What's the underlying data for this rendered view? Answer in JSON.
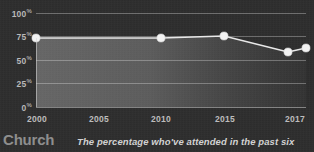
{
  "chart_data": {
    "type": "area",
    "title": "",
    "subtitle": "",
    "xlabel": "",
    "ylabel": "",
    "x": [
      "2000",
      "2005",
      "2010",
      "2015",
      "2017"
    ],
    "categories": [
      "2000",
      "2005",
      "2010",
      "2015",
      "2017"
    ],
    "values": [
      70,
      70,
      71,
      61,
      63
    ],
    "series": [
      {
        "name": "Church attendance",
        "values": [
          70,
          70,
          71,
          61,
          63
        ]
      }
    ],
    "ylim": [
      0,
      100
    ],
    "ytick_labels": [
      "100%",
      "75%",
      "50%",
      "25%",
      "0%"
    ],
    "ytick_values": [
      100,
      75,
      50,
      25,
      0
    ],
    "xtick_labels": [
      "2000",
      "2005",
      "2010",
      "2015",
      "2017"
    ],
    "grid": true,
    "legend": "none",
    "colors": {
      "background": "#2e2e2e",
      "line": "#e8e8e8",
      "marker": "#f2f2f2",
      "gridline": "#cdcdcd",
      "tick_text": "#bdbdbd",
      "category_title": "#8e8e8e",
      "caption_text": "#d2d2d2"
    }
  },
  "axis": {
    "y_ticks": [
      {
        "label": "100",
        "suffix": "%",
        "value": 100
      },
      {
        "label": "75",
        "suffix": "%",
        "value": 75
      },
      {
        "label": "50",
        "suffix": "%",
        "value": 50
      },
      {
        "label": "25",
        "suffix": "%",
        "value": 25
      },
      {
        "label": "0",
        "suffix": "%",
        "value": 0
      }
    ],
    "x_ticks": [
      {
        "label": "2000"
      },
      {
        "label": "2005"
      },
      {
        "label": "2010"
      },
      {
        "label": "2015"
      },
      {
        "label": "2017"
      }
    ]
  },
  "footer": {
    "category_title": "Church",
    "caption": "The percentage who've attended in the past six"
  }
}
